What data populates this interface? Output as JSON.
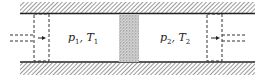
{
  "diagram": {
    "type": "throttling-process-schematic",
    "left_chamber": {
      "pressure": "p",
      "pressure_sub": "1",
      "temperature": "T",
      "temperature_sub": "1"
    },
    "right_chamber": {
      "pressure": "p",
      "pressure_sub": "2",
      "temperature": "T",
      "temperature_sub": "2"
    },
    "separator": ", ",
    "components": [
      "upper-wall",
      "lower-wall",
      "left-piston",
      "porous-plug",
      "right-piston"
    ],
    "colors": {
      "line": "#222222",
      "hatch": "#555555",
      "plug": "#999999",
      "background": "#ffffff"
    }
  }
}
